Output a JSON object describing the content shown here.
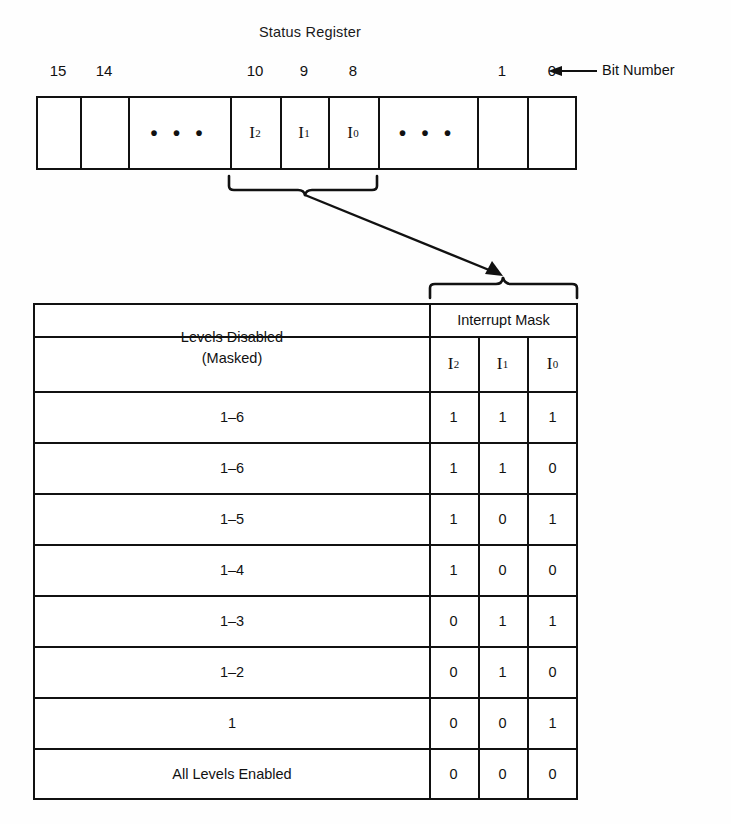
{
  "figure": {
    "title": "Status Register",
    "bit_number_caption": "Bit Number",
    "register": {
      "bit_labels": [
        "15",
        "14",
        "10",
        "9",
        "8",
        "1",
        "0"
      ],
      "cells": [
        {
          "label": "",
          "kind": "empty"
        },
        {
          "label": "",
          "kind": "empty"
        },
        {
          "label": "...",
          "kind": "ellipsis"
        },
        {
          "label": "I2",
          "base": "I",
          "sub": "2",
          "kind": "bit"
        },
        {
          "label": "I1",
          "base": "I",
          "sub": "1",
          "kind": "bit"
        },
        {
          "label": "I0",
          "base": "I",
          "sub": "0",
          "kind": "bit"
        },
        {
          "label": "...",
          "kind": "ellipsis"
        },
        {
          "label": "",
          "kind": "empty"
        },
        {
          "label": "",
          "kind": "empty"
        }
      ]
    },
    "table": {
      "col_header_levels_line1": "Levels Disabled",
      "col_header_levels_line2": "(Masked)",
      "col_header_mask": "Interrupt Mask",
      "mask_bits": [
        {
          "base": "I",
          "sub": "2"
        },
        {
          "base": "I",
          "sub": "1"
        },
        {
          "base": "I",
          "sub": "0"
        }
      ],
      "rows": [
        {
          "levels": "1–6",
          "bits": [
            "1",
            "1",
            "1"
          ]
        },
        {
          "levels": "1–6",
          "bits": [
            "1",
            "1",
            "0"
          ]
        },
        {
          "levels": "1–5",
          "bits": [
            "1",
            "0",
            "1"
          ]
        },
        {
          "levels": "1–4",
          "bits": [
            "1",
            "0",
            "0"
          ]
        },
        {
          "levels": "1–3",
          "bits": [
            "0",
            "1",
            "1"
          ]
        },
        {
          "levels": "1–2",
          "bits": [
            "0",
            "1",
            "0"
          ]
        },
        {
          "levels": "1",
          "bits": [
            "0",
            "0",
            "1"
          ]
        },
        {
          "levels": "All Levels Enabled",
          "bits": [
            "0",
            "0",
            "0"
          ]
        }
      ]
    },
    "colors": {
      "ink": "#111111",
      "paper": "#fefefe"
    }
  }
}
